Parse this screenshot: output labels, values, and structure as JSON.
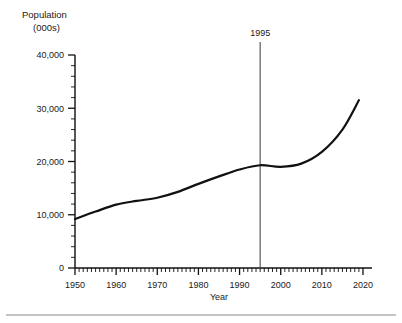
{
  "chart_data": {
    "type": "line",
    "title": "",
    "ylabel": "Population",
    "ylabel_unit": "(000s)",
    "xlabel": "Year",
    "xlim": [
      1950,
      2020
    ],
    "ylim": [
      0,
      40000
    ],
    "grid": false,
    "legend": null,
    "y_ticks": [
      0,
      10000,
      20000,
      30000,
      40000
    ],
    "y_tick_labels": [
      "0",
      "10,000",
      "20,000",
      "30,000",
      "40,000"
    ],
    "y_minor_step": 2000,
    "x_ticks": [
      1950,
      1960,
      1970,
      1980,
      1990,
      2000,
      2010,
      2020
    ],
    "x_tick_labels": [
      "1950",
      "1960",
      "1970",
      "1980",
      "1990",
      "2000",
      "2010",
      "2020"
    ],
    "x_minor_step": 1,
    "series": [
      {
        "name": "Population",
        "x": [
          1950,
          1955,
          1960,
          1965,
          1970,
          1975,
          1980,
          1985,
          1990,
          1995,
          2000,
          2005,
          2010,
          2015,
          2019
        ],
        "values": [
          9200,
          10600,
          11900,
          12600,
          13200,
          14300,
          15800,
          17200,
          18500,
          19300,
          19000,
          19600,
          21800,
          26000,
          31500
        ]
      }
    ],
    "annotations": [
      {
        "type": "vertical-line",
        "label": "1995",
        "x": 1995
      }
    ]
  },
  "footer": {
    "rule": true
  }
}
